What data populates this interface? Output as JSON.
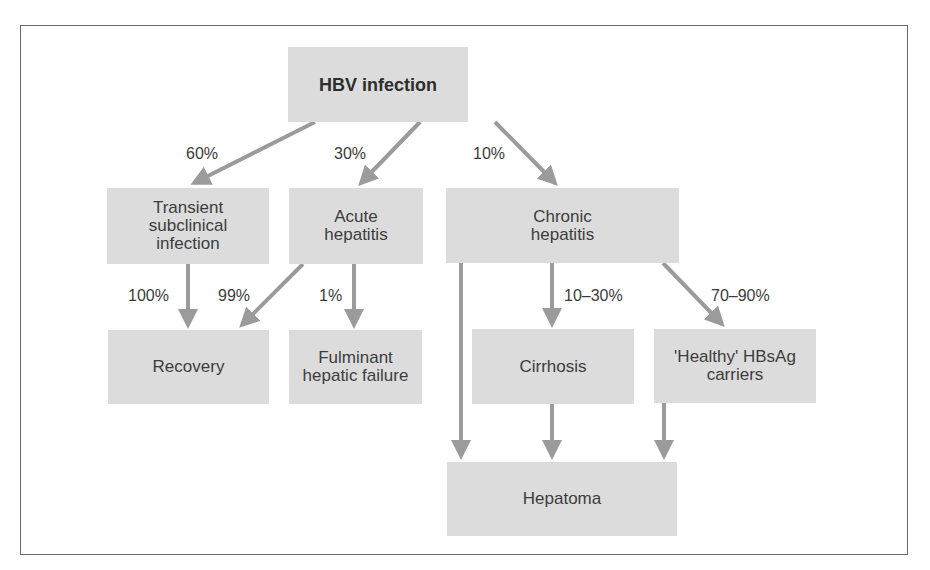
{
  "diagram": {
    "type": "flowchart",
    "colors": {
      "box_fill": "#dcdcdc",
      "arrow": "#9b9b9b",
      "text": "#3c3c3c",
      "frame": "#6a6a6a"
    },
    "nodes": {
      "hbv": "HBV infection",
      "transient": "Transient\nsubclinical\ninfection",
      "acute": "Acute\nhepatitis",
      "chronic": "Chronic\nhepatitis",
      "recovery": "Recovery",
      "fulminant": "Fulminant\nhepatic failure",
      "cirrhosis": "Cirrhosis",
      "carriers": "'Healthy' HBsAg\ncarriers",
      "hepatoma": "Hepatoma"
    },
    "edge_labels": {
      "hbv_transient": "60%",
      "hbv_acute": "30%",
      "hbv_chronic": "10%",
      "transient_recovery": "100%",
      "acute_recovery": "99%",
      "acute_fulminant": "1%",
      "chronic_cirrhosis": "10–30%",
      "chronic_carriers": "70–90%"
    },
    "edges": [
      {
        "from": "HBV infection",
        "to": "Transient subclinical infection",
        "label": "60%"
      },
      {
        "from": "HBV infection",
        "to": "Acute hepatitis",
        "label": "30%"
      },
      {
        "from": "HBV infection",
        "to": "Chronic hepatitis",
        "label": "10%"
      },
      {
        "from": "Transient subclinical infection",
        "to": "Recovery",
        "label": "100%"
      },
      {
        "from": "Acute hepatitis",
        "to": "Recovery",
        "label": "99%"
      },
      {
        "from": "Acute hepatitis",
        "to": "Fulminant hepatic failure",
        "label": "1%"
      },
      {
        "from": "Chronic hepatitis",
        "to": "Cirrhosis",
        "label": "10–30%"
      },
      {
        "from": "Chronic hepatitis",
        "to": "'Healthy' HBsAg carriers",
        "label": "70–90%"
      },
      {
        "from": "Chronic hepatitis",
        "to": "Hepatoma",
        "label": ""
      },
      {
        "from": "Cirrhosis",
        "to": "Hepatoma",
        "label": ""
      },
      {
        "from": "'Healthy' HBsAg carriers",
        "to": "Hepatoma",
        "label": ""
      }
    ]
  }
}
